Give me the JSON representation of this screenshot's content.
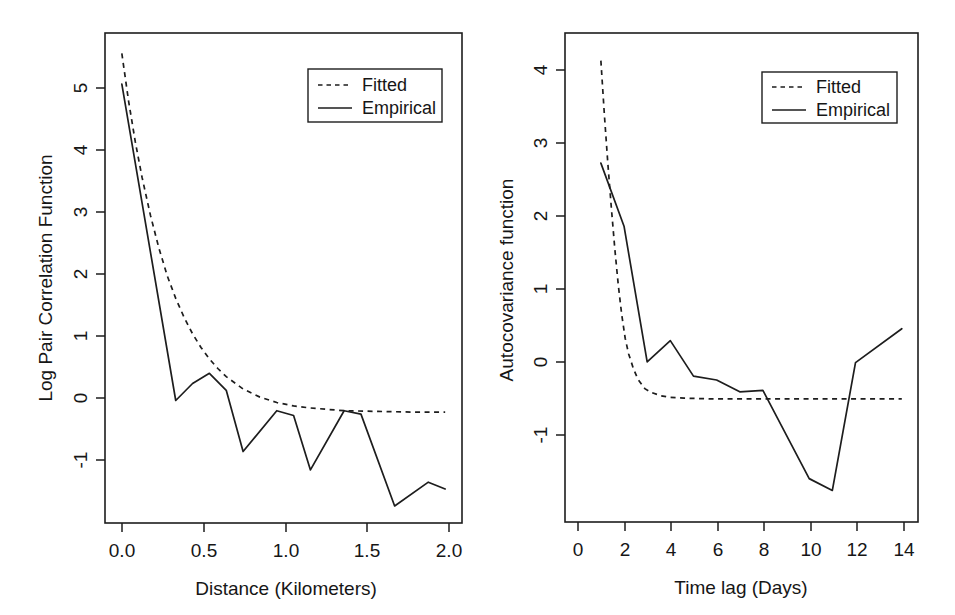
{
  "figure": {
    "background": "#ffffff",
    "ink_color": "#1d1d1d",
    "panel_count": 2
  },
  "chart_data": [
    {
      "type": "line",
      "panel": "left",
      "title": "",
      "xlabel": "Distance (Kilometers)",
      "ylabel": "Log Pair Correlation Function",
      "xlim": [
        -0.02,
        2.1
      ],
      "ylim": [
        -1.6,
        5.6
      ],
      "xticks": [
        0.0,
        0.5,
        1.0,
        1.5,
        2.0
      ],
      "xticklabels": [
        "0.0",
        "0.5",
        "1.0",
        "1.5",
        "2.0"
      ],
      "yticks": [
        -1,
        0,
        1,
        2,
        3,
        4,
        5
      ],
      "yticklabels": [
        "-1",
        "0",
        "1",
        "2",
        "3",
        "4",
        "5"
      ],
      "grid": false,
      "legend": {
        "position": "top-right",
        "entries": [
          {
            "label": "Fitted",
            "style": "dashed"
          },
          {
            "label": "Empirical",
            "style": "solid"
          }
        ]
      },
      "series": [
        {
          "name": "Fitted",
          "style": "dashed",
          "x": [
            0.08,
            0.12,
            0.16,
            0.2,
            0.25,
            0.3,
            0.35,
            0.4,
            0.45,
            0.5,
            0.55,
            0.6,
            0.65,
            0.7,
            0.8,
            0.9,
            1.0,
            1.1,
            1.2,
            1.4,
            1.6,
            1.8,
            2.0
          ],
          "y": [
            5.3,
            4.6,
            4.0,
            3.48,
            2.92,
            2.44,
            2.03,
            1.7,
            1.42,
            1.18,
            0.98,
            0.81,
            0.67,
            0.55,
            0.37,
            0.25,
            0.17,
            0.12,
            0.09,
            0.05,
            0.04,
            0.03,
            0.03
          ]
        },
        {
          "name": "Empirical",
          "style": "solid",
          "x": [
            0.08,
            0.4,
            0.5,
            0.6,
            0.7,
            0.8,
            1.0,
            1.1,
            1.2,
            1.4,
            1.5,
            1.7,
            1.9,
            2.0
          ],
          "y": [
            4.85,
            0.2,
            0.45,
            0.6,
            0.35,
            -0.55,
            0.05,
            -0.02,
            -0.82,
            0.05,
            0.0,
            -1.35,
            -1.0,
            -1.1
          ]
        }
      ]
    },
    {
      "type": "line",
      "panel": "right",
      "title": "",
      "xlabel": "Time lag (Days)",
      "ylabel": "Autocovariance function",
      "xlim": [
        -0.55,
        14.7
      ],
      "ylim": [
        -1.75,
        4.45
      ],
      "xticks": [
        0,
        2,
        4,
        6,
        8,
        10,
        12,
        14
      ],
      "xticklabels": [
        "0",
        "2",
        "4",
        "6",
        "8",
        "10",
        "12",
        "14"
      ],
      "yticks": [
        -1,
        0,
        1,
        2,
        3,
        4
      ],
      "yticklabels": [
        "-1",
        "0",
        "1",
        "2",
        "3",
        "4"
      ],
      "grid": false,
      "legend": {
        "position": "top-right",
        "entries": [
          {
            "label": "Fitted",
            "style": "dashed"
          },
          {
            "label": "Empirical",
            "style": "solid"
          }
        ]
      },
      "series": [
        {
          "name": "Fitted",
          "style": "dashed",
          "x": [
            1.0,
            1.15,
            1.3,
            1.45,
            1.6,
            1.75,
            1.9,
            2.05,
            2.2,
            2.4,
            2.6,
            2.9,
            3.2,
            3.6,
            4.0,
            4.6,
            5.2,
            6.0,
            7.0,
            8.0,
            10.0,
            12.0,
            14.0
          ],
          "y": [
            4.1,
            3.42,
            2.8,
            2.24,
            1.72,
            1.26,
            0.88,
            0.58,
            0.38,
            0.2,
            0.06,
            -0.06,
            -0.11,
            -0.15,
            -0.17,
            -0.18,
            -0.185,
            -0.19,
            -0.19,
            -0.19,
            -0.19,
            -0.19,
            -0.19
          ]
        },
        {
          "name": "Empirical",
          "style": "solid",
          "x": [
            1,
            2,
            3,
            4,
            5,
            6,
            7,
            8,
            10,
            11,
            12,
            14
          ],
          "y": [
            2.8,
            2.0,
            0.28,
            0.55,
            0.1,
            0.05,
            -0.1,
            -0.08,
            -1.2,
            -1.35,
            0.27,
            0.7
          ]
        }
      ]
    }
  ]
}
